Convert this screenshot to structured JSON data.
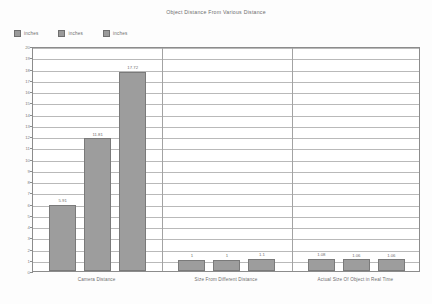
{
  "chart_data": {
    "type": "bar",
    "title": "Object Distance From Various Distance",
    "xlabel": "",
    "ylabel": "",
    "ylim": [
      0,
      20
    ],
    "ytick_step": 1,
    "yticks": [
      "20",
      "19",
      "18",
      "17",
      "16",
      "15",
      "14",
      "13",
      "12",
      "11",
      "10",
      "9",
      "8",
      "7",
      "6",
      "5",
      "4",
      "3",
      "2",
      "1",
      "0"
    ],
    "grid": true,
    "legend_position": "top-left",
    "bar_color": "#9d9d9d",
    "bar_border_color": "#7a7a7a",
    "categories": [
      "Camera Distance",
      "Size From Different Distance",
      "Actual Size Of Object in Real Time"
    ],
    "legend": [
      {
        "label": "inches",
        "color": "#9a9a9a"
      },
      {
        "label": "inches",
        "color": "#9a9a9a"
      },
      {
        "label": "inches",
        "color": "#9a9a9a"
      }
    ],
    "series": [
      {
        "name": "inches",
        "values": [
          5.91,
          1,
          1.08
        ]
      },
      {
        "name": "inches",
        "values": [
          11.81,
          1,
          1.06
        ]
      },
      {
        "name": "inches",
        "values": [
          17.72,
          1.1,
          1.06
        ]
      }
    ],
    "data_labels": [
      [
        "5.91",
        "1",
        "1.08"
      ],
      [
        "11.81",
        "1",
        "1.06"
      ],
      [
        "17.72",
        "1.1",
        "1.06"
      ]
    ]
  }
}
